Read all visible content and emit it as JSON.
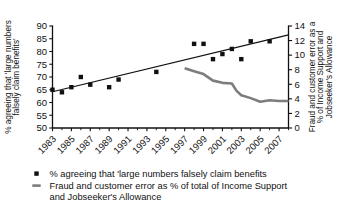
{
  "chart_data": {
    "type": "scatter",
    "title": "",
    "xlabel": "",
    "ylabel": "% agreeing that 'large numbers falsely claim benefits'",
    "y2label": "Fraud and customer error as a % of Income Support and Jobseeker's Allowance",
    "xlim": [
      1983,
      2008
    ],
    "ylim": [
      50,
      90
    ],
    "y2lim": [
      0,
      14
    ],
    "grid": false,
    "legend_position": "below",
    "x_tick_labels": [
      "1983",
      "1985",
      "1987",
      "1989",
      "1991",
      "1993",
      "1995",
      "1997",
      "1999",
      "2001",
      "2003",
      "2005",
      "2007"
    ],
    "x_tick_values": [
      1983,
      1985,
      1987,
      1989,
      1991,
      1993,
      1995,
      1997,
      1999,
      2001,
      2003,
      2005,
      2007
    ],
    "y_tick_labels": [
      "50",
      "55",
      "60",
      "65",
      "70",
      "75",
      "80",
      "85",
      "90"
    ],
    "y_tick_values": [
      50,
      55,
      60,
      65,
      70,
      75,
      80,
      85,
      90
    ],
    "y2_tick_labels": [
      "0",
      "2",
      "4",
      "6",
      "8",
      "10",
      "12",
      "14"
    ],
    "y2_tick_values": [
      0,
      2,
      4,
      6,
      8,
      10,
      12,
      14
    ],
    "series": [
      {
        "name": "% agreeing that 'large numbers falsely claim benefits",
        "type": "scatter",
        "axis": "left",
        "marker": "square",
        "color": "#111111",
        "points": [
          {
            "x": 1983,
            "y": 65
          },
          {
            "x": 1984,
            "y": 64
          },
          {
            "x": 1985,
            "y": 66
          },
          {
            "x": 1986,
            "y": 70
          },
          {
            "x": 1987,
            "y": 67
          },
          {
            "x": 1989,
            "y": 66
          },
          {
            "x": 1990,
            "y": 69
          },
          {
            "x": 1994,
            "y": 72
          },
          {
            "x": 1998,
            "y": 83
          },
          {
            "x": 1999,
            "y": 83
          },
          {
            "x": 2000,
            "y": 77
          },
          {
            "x": 2001,
            "y": 79
          },
          {
            "x": 2002,
            "y": 81
          },
          {
            "x": 2003,
            "y": 77
          },
          {
            "x": 2004,
            "y": 84
          },
          {
            "x": 2006,
            "y": 84
          }
        ]
      },
      {
        "name": "trend line",
        "type": "line",
        "axis": "left",
        "color": "#111111",
        "points": [
          {
            "x": 1983,
            "y": 64.2
          },
          {
            "x": 2008,
            "y": 86.5
          }
        ]
      },
      {
        "name": "Fraud and customer error as % of total of Income Support and Jobseeker's Allowance",
        "type": "line",
        "axis": "right",
        "color": "#7d7d7d",
        "points": [
          {
            "x": 1997,
            "y": 8.2
          },
          {
            "x": 1998,
            "y": 7.8
          },
          {
            "x": 1999,
            "y": 7.4
          },
          {
            "x": 2000,
            "y": 6.5
          },
          {
            "x": 2001,
            "y": 6.2
          },
          {
            "x": 2002,
            "y": 6.1
          },
          {
            "x": 2002.5,
            "y": 5.1
          },
          {
            "x": 2003,
            "y": 4.5
          },
          {
            "x": 2004,
            "y": 4.1
          },
          {
            "x": 2005,
            "y": 3.6
          },
          {
            "x": 2006,
            "y": 3.8
          },
          {
            "x": 2007,
            "y": 3.7
          },
          {
            "x": 2008,
            "y": 3.7
          }
        ]
      }
    ],
    "legend": [
      {
        "marker": "square",
        "color": "#111111",
        "label_lines": [
          "% agreeing that 'large numbers falsely claim benefits"
        ]
      },
      {
        "marker": "line",
        "color": "#7d7d7d",
        "label_lines": [
          "Fraud and customer error as % of total of Income Support",
          "and Jobseeker's Allowance"
        ]
      }
    ]
  },
  "axes": {
    "left_title_lines": [
      "% agreeing that 'large numbers",
      "falsely claim benefits'"
    ],
    "right_title_lines": [
      "Fraud and customer error as a",
      "% of Income Support and",
      "Jobseeker's Allowance"
    ]
  }
}
